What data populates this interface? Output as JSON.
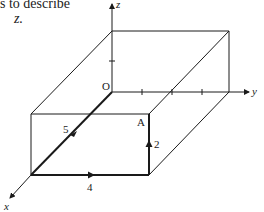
{
  "caption": {
    "line1": "s to describe",
    "line2": "z."
  },
  "diagram": {
    "type": "3d-cuboid-vector-path",
    "axes": {
      "x": "x",
      "y": "y",
      "z": "z"
    },
    "origin_label": "O",
    "point_label": "A",
    "vectors": [
      {
        "label": "5",
        "direction": "along x-axis"
      },
      {
        "label": "4",
        "direction": "along y-axis"
      },
      {
        "label": "2",
        "direction": "along z-axis"
      }
    ],
    "colors": {
      "line": "#1a1a1a",
      "background": "#ffffff"
    }
  }
}
